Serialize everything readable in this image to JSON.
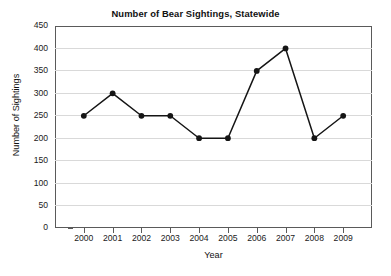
{
  "chart_data": {
    "type": "line",
    "title": "Number of Bear Sightings, Statewide",
    "xlabel": "Year",
    "ylabel": "Number of Sightings",
    "categories": [
      "2000",
      "2001",
      "2002",
      "2003",
      "2004",
      "2005",
      "2006",
      "2007",
      "2008",
      "2009"
    ],
    "x": [
      2000,
      2001,
      2002,
      2003,
      2004,
      2005,
      2006,
      2007,
      2008,
      2009
    ],
    "values": [
      250,
      300,
      250,
      250,
      200,
      200,
      350,
      400,
      200,
      250
    ],
    "series": [
      {
        "name": "Number of Sightings",
        "values": [
          250,
          300,
          250,
          250,
          200,
          200,
          350,
          400,
          200,
          250
        ]
      }
    ],
    "ylim": [
      0,
      450
    ],
    "yticks": [
      0,
      50,
      100,
      150,
      200,
      250,
      300,
      350,
      400,
      450
    ],
    "ytick_labels": [
      "0",
      "50",
      "100",
      "150",
      "200",
      "250",
      "300",
      "350",
      "400",
      "450"
    ],
    "xtick_labels": [
      "2000",
      "2001",
      "2002",
      "2003",
      "2004",
      "2005",
      "2006",
      "2007",
      "2008",
      "2009"
    ],
    "grid": true,
    "grid_axis": "y",
    "legend": false,
    "legend_position": "none",
    "marker": "filled-circle",
    "colors": {
      "line": "#151515",
      "marker": "#151515",
      "grid": "#d9d9d9",
      "frame": "#5a5a5a",
      "background": "#ffffff",
      "text": "#111111"
    }
  }
}
